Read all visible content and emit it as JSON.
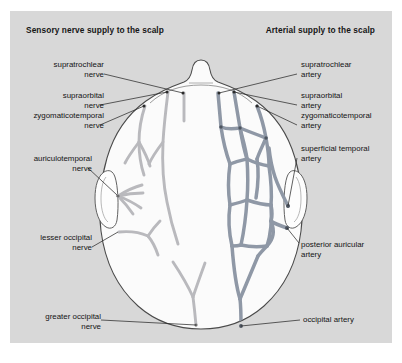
{
  "figure": {
    "panel_bg": "#d8d8d8",
    "page_bg": "#ffffff",
    "nerve_color": "#b9b9bd",
    "artery_color": "#8f98a6",
    "outline_color": "#4a4a4a",
    "leader_color": "#2b2b2b",
    "head_fill": "#fbfbfb"
  },
  "headers": {
    "left": "Sensory nerve supply to the scalp",
    "right": "Arterial supply to the scalp"
  },
  "labels_left": [
    {
      "id": "supratrochlear-nerve",
      "line1": "supratrochlear",
      "line2": "nerve"
    },
    {
      "id": "supraorbital-nerve",
      "line1": "supraorbital",
      "line2": "nerve"
    },
    {
      "id": "zygomaticotemporal-nerve",
      "line1": "zygomaticotemporal",
      "line2": "nerve"
    },
    {
      "id": "auriculotemporal-nerve",
      "line1": "auriculotemporal",
      "line2": "nerve"
    },
    {
      "id": "lesser-occipital-nerve",
      "line1": "lesser occipital",
      "line2": "nerve"
    }
  ],
  "labels_right": [
    {
      "id": "supratrochlear-artery",
      "line1": "supratrochlear",
      "line2": "artery"
    },
    {
      "id": "supraorbital-artery",
      "line1": "supraorbital",
      "line2": "artery"
    },
    {
      "id": "zygomaticotemporal-artery",
      "line1": "zygomaticotemporal",
      "line2": "artery"
    },
    {
      "id": "superficial-temporal-artery",
      "line1": "superficial temporal",
      "line2": "artery"
    },
    {
      "id": "posterior-auricular-artery",
      "line1": "posterior auricular",
      "line2": "artery"
    }
  ],
  "labels_bottom": [
    {
      "id": "greater-occipital-nerve",
      "line1": "greater occipital",
      "line2": "nerve"
    },
    {
      "id": "occipital-artery",
      "line1": "occipital artery",
      "line2": ""
    }
  ]
}
